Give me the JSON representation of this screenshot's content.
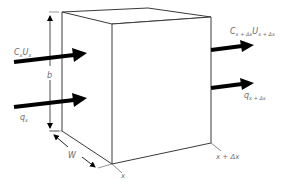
{
  "diagram": {
    "colors": {
      "edge": "#3a3a3a",
      "arrow": "#000000",
      "text": "#6b6b6b",
      "background": "#ffffff"
    },
    "labels": {
      "inflow_conc_main": "C",
      "inflow_conc_sub": "x",
      "inflow_vel_main": "U",
      "inflow_vel_sub": "x",
      "outflow_conc_main": "C",
      "outflow_conc_sub": "x + Δx",
      "outflow_vel_main": "U",
      "outflow_vel_sub": "x + Δx",
      "inflow_q_main": "q",
      "inflow_q_sub": "x",
      "outflow_q_main": "q",
      "outflow_q_sub": "x + Δx",
      "height": "b",
      "width": "W",
      "x_start": "x",
      "x_end": "x + Δx"
    }
  }
}
